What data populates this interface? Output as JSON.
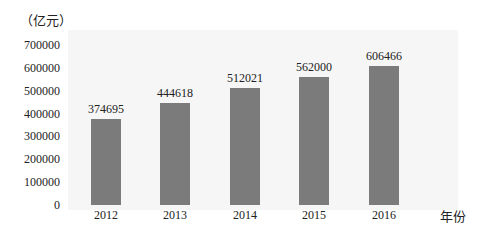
{
  "chart_data": {
    "type": "bar",
    "title": "",
    "xlabel": "年份",
    "ylabel": "（亿元）",
    "categories": [
      "2012",
      "2013",
      "2014",
      "2015",
      "2016"
    ],
    "values": [
      374695,
      444618,
      512021,
      562000,
      606466
    ],
    "value_labels": [
      "374695",
      "444618",
      "512021",
      "562000",
      "606466"
    ],
    "yticks": [
      "700000",
      "600000",
      "500000",
      "400000",
      "300000",
      "200000",
      "100000",
      "0"
    ],
    "ylim": [
      0,
      700000
    ],
    "grid": false,
    "legend": null,
    "bar_color": "#7b7b7b"
  }
}
